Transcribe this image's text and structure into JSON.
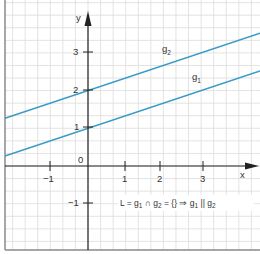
{
  "chart_data": {
    "type": "line",
    "title": "",
    "xlabel": "x",
    "ylabel": "y",
    "xlim": [
      -2.2,
      4.6
    ],
    "ylim": [
      -2.2,
      4.4
    ],
    "grid": true,
    "grid_minor_step": 0.3333,
    "x_ticks": [
      -1,
      1,
      2,
      3
    ],
    "x_tick_labels": [
      "−1",
      "1",
      "2",
      "3"
    ],
    "y_ticks": [
      -1,
      1,
      2,
      3
    ],
    "y_tick_labels": [
      "−1",
      "1",
      "2",
      "3"
    ],
    "origin_label": "0",
    "series": [
      {
        "name": "g1",
        "label_main": "g",
        "label_sub": "1",
        "slope": 0.3333,
        "intercept": 1,
        "color": "#3a9cc4"
      },
      {
        "name": "g2",
        "label_main": "g",
        "label_sub": "2",
        "slope": 0.3333,
        "intercept": 2,
        "color": "#3a9cc4"
      }
    ],
    "annotation": "L = g1 ∩ g2 = {} ⇒ g1 || g2"
  },
  "labels": {
    "x_axis": "x",
    "y_axis": "y",
    "origin": "0",
    "xt_m1": "−1",
    "xt_1": "1",
    "xt_2": "2",
    "xt_3": "3",
    "yt_m1": "−1",
    "yt_1": "1",
    "yt_2": "2",
    "yt_3": "3",
    "g1_main": "g",
    "g1_sub": "1",
    "g2_main": "g",
    "g2_sub": "2",
    "ann_L": "L = g",
    "ann_s1": "1",
    "ann_cap": " ∩ g",
    "ann_s2": "2",
    "ann_eq": " = {} ⇒ g",
    "ann_s3": "1",
    "ann_par": " || g",
    "ann_s4": "2"
  },
  "colors": {
    "line": "#3a9cc4",
    "grid": "#d9d9d9",
    "axis": "#222222",
    "frame": "#8a8a8a"
  }
}
